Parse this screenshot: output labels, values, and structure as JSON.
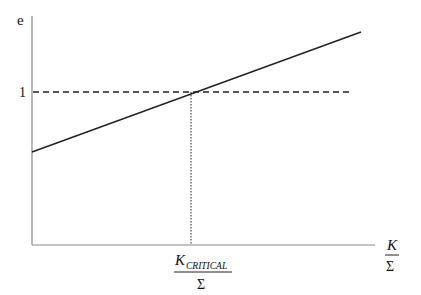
{
  "diagram": {
    "y_axis_label": "e",
    "y_tick_label": "1",
    "x_axis_label": {
      "numerator": "K",
      "denominator": "Σ"
    },
    "critical_label": {
      "numerator": "K",
      "subscript": "CRITICAL",
      "denominator": "Σ"
    },
    "lines": [
      {
        "name": "e-vs-K-over-Sigma",
        "style": "solid",
        "from": [
          32,
          152
        ],
        "to": [
          361,
          32
        ]
      },
      {
        "name": "e-equals-1",
        "style": "dashed",
        "from": [
          33,
          92
        ],
        "to": [
          352,
          92
        ]
      },
      {
        "name": "critical-K-marker",
        "style": "dotted",
        "from": [
          191,
          92
        ],
        "to": [
          191,
          245
        ]
      }
    ],
    "colors": {
      "axis": "#8a8a8a",
      "line": "#222222"
    }
  }
}
